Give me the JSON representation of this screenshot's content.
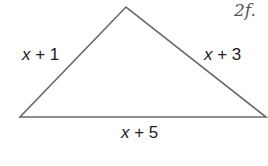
{
  "diagram": {
    "shape": "triangle",
    "vertices": {
      "top": [
        126,
        7
      ],
      "left": [
        20,
        117
      ],
      "right": [
        266,
        117
      ]
    },
    "stroke_color": "#6b6b6b",
    "sides": {
      "left": {
        "var": "x",
        "rest": " + 1"
      },
      "right": {
        "var": "x",
        "rest": " + 3"
      },
      "bottom": {
        "var": "x",
        "rest": " + 5"
      }
    },
    "handwritten_mark": "2f."
  }
}
